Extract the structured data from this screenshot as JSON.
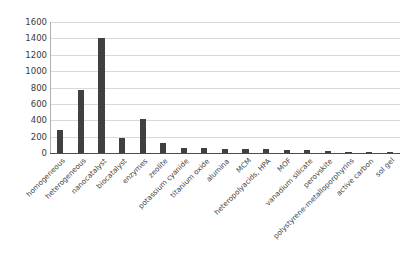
{
  "chart_data": {
    "type": "bar",
    "title": "",
    "xlabel": "",
    "ylabel": "",
    "ylim": [
      0,
      1600
    ],
    "yticks": [
      0,
      200,
      400,
      600,
      800,
      1000,
      1200,
      1400,
      1600
    ],
    "grid": true,
    "legend": "none",
    "bar_color": "#404040",
    "gridline_color": "#d9d9d9",
    "axis_color": "#4d4d4d",
    "background": "#ffffff",
    "categories": [
      "homogeneous",
      "heterogeneous",
      "nanocatalyst",
      "biocatalyst",
      "enzymes",
      "zeolite",
      "potassium cyanide",
      "titanium oxide",
      "alumina",
      "MCM",
      "heteropolyacids, HPA",
      "MOF",
      "vanadium silicate",
      "perovskite",
      "polystyrene-metalloporphyrins",
      "active carbon",
      "sol gel"
    ],
    "values": [
      280,
      770,
      1410,
      180,
      420,
      125,
      65,
      60,
      55,
      50,
      45,
      40,
      38,
      25,
      12,
      10,
      8
    ]
  }
}
